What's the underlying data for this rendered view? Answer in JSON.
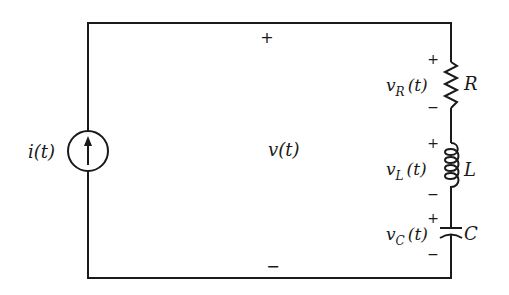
{
  "diagram": {
    "type": "circuit",
    "topology": "current source in parallel with series RLC branch",
    "source": {
      "kind": "current-source",
      "label": "i(t)",
      "arrow": "up"
    },
    "overall_voltage": {
      "label": "v(t)",
      "plus": "+",
      "minus": "−"
    },
    "components": [
      {
        "id": "R",
        "kind": "resistor",
        "label": "R",
        "voltage_main": "v",
        "voltage_sub": "R",
        "voltage_arg": "(t)",
        "plus": "+",
        "minus": "−"
      },
      {
        "id": "L",
        "kind": "inductor",
        "label": "L",
        "voltage_main": "v",
        "voltage_sub": "L",
        "voltage_arg": "(t)",
        "plus": "+",
        "minus": "−"
      },
      {
        "id": "C",
        "kind": "capacitor",
        "label": "C",
        "voltage_main": "v",
        "voltage_sub": "C",
        "voltage_arg": "(t)",
        "plus": "+",
        "minus": "−"
      }
    ],
    "colors": {
      "ink": "#1a1a1a",
      "background": "#ffffff"
    }
  }
}
